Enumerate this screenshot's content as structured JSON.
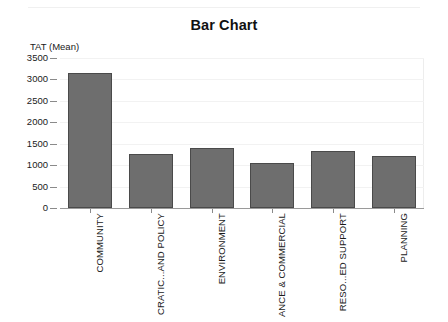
{
  "chart_data": {
    "type": "bar",
    "title": "Bar Chart",
    "xlabel": "",
    "ylabel": "TAT (Mean)",
    "categories": [
      "COMMUNITY",
      "CRATIC...AND POLICY",
      "ENVIRONMENT",
      "ANCE & COMMERCIAL",
      "RESO...ED SUPPORT",
      "PLANNING"
    ],
    "values": [
      3160,
      1270,
      1390,
      1040,
      1340,
      1220
    ],
    "ylim": [
      0,
      3500
    ],
    "ytick_labels": [
      "0",
      "500",
      "1000",
      "1500",
      "2000",
      "2500",
      "3000",
      "3500"
    ],
    "ytick_values": [
      0,
      500,
      1000,
      1500,
      2000,
      2500,
      3000,
      3500
    ],
    "grid": false,
    "legend": "none",
    "bar_color": "#6e6e6e",
    "bar_border_color": "#4a4a4a",
    "background_color": "#ffffff",
    "axis_color": "#9a9a9a"
  }
}
